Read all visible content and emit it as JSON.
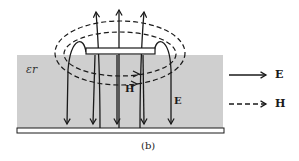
{
  "figure": {
    "caption": "(b)",
    "dielectric_label": "εr",
    "field_labels": {
      "h_inline": "H",
      "e_inline": "E"
    },
    "legend": [
      {
        "symbol": "solid-arrow",
        "label": "E"
      },
      {
        "symbol": "dashed-arrow",
        "label": "H"
      }
    ],
    "colors": {
      "dielectric": "#cfcfcf",
      "lines": "#1a1a1a",
      "conductor_fill": "#ffffff"
    }
  }
}
